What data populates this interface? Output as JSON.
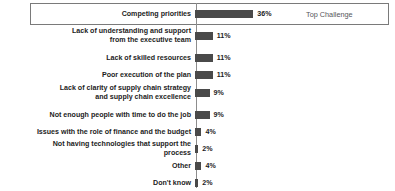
{
  "chart_data": {
    "type": "bar",
    "orientation": "horizontal",
    "title": "",
    "xlabel": "",
    "ylabel": "",
    "xlim": [
      0,
      36
    ],
    "grid": false,
    "legend": null,
    "value_suffix": "%",
    "categories": [
      "Competing priorities",
      "Lack of understanding and support\nfrom the executive team",
      "Lack of skilled resources",
      "Poor execution of the plan",
      "Lack of clarity of supply chain strategy\nand supply chain excellence",
      "Not enough people with time to do the job",
      "Issues with the role of finance and the budget",
      "Not having technologies that support the process",
      "Other",
      "Don't know"
    ],
    "values": [
      36,
      11,
      11,
      11,
      9,
      9,
      4,
      2,
      4,
      2
    ],
    "value_labels": [
      "36%",
      "11%",
      "11%",
      "11%",
      "9%",
      "9%",
      "4%",
      "2%",
      "4%",
      "2%"
    ],
    "annotations": [
      {
        "text": "Top Challenge",
        "target_category": "Competing priorities"
      }
    ],
    "highlighted_category": "Competing priorities",
    "colors": {
      "bar": "#4a4a4a",
      "axis": "#8d8d8d",
      "highlight_border": "#7a7a7a",
      "label_text": "#1c1c1c",
      "annotation_text": "#55565a",
      "background": "#ffffff"
    }
  }
}
